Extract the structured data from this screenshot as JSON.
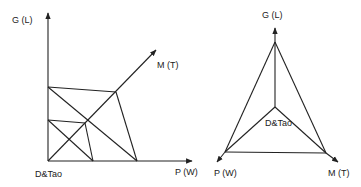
{
  "left_diagram": {
    "axis_y_label": "G (L)",
    "axis_diag_label": "M (T)",
    "axis_x_label": "P (W)",
    "origin_label": "D&Tao"
  },
  "right_diagram": {
    "top_label": "G (L)",
    "left_label": "P (W)",
    "right_label": "M (T)",
    "center_label": "D&Tao"
  },
  "colors": {
    "line": "#222222",
    "background": "#ffffff"
  }
}
